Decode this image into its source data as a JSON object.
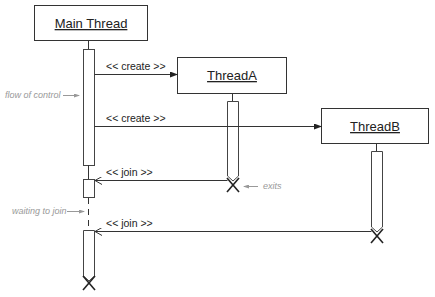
{
  "diagram": {
    "type": "sequence",
    "objects": [
      {
        "id": "main",
        "label": "Main Thread"
      },
      {
        "id": "threadA",
        "label": "ThreadA"
      },
      {
        "id": "threadB",
        "label": "ThreadB"
      }
    ],
    "messages": [
      {
        "from": "main",
        "to": "threadA",
        "label": "<< create >>"
      },
      {
        "from": "main",
        "to": "threadB",
        "label": "<< create >>"
      },
      {
        "from": "threadA",
        "to": "main",
        "label": "<< join >>"
      },
      {
        "from": "threadB",
        "to": "main",
        "label": "<< join >>"
      }
    ],
    "notes": [
      {
        "label": "flow of control"
      },
      {
        "label": "waiting to join"
      },
      {
        "label": "exits"
      }
    ]
  },
  "colors": {
    "line": "#333333",
    "note": "#999999",
    "background": "#ffffff"
  }
}
